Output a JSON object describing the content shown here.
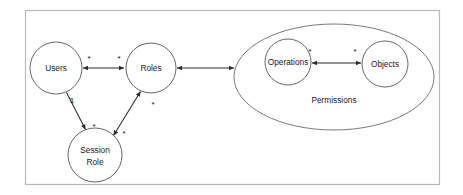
{
  "diagram": {
    "frame": {
      "name": "diagram-frame",
      "border_color": "#b9b9b9",
      "background": "#ffffff"
    },
    "colors": {
      "node_stroke": "#555555",
      "group_stroke": "#6b6b6b",
      "edge_stroke": "#2b2b2b",
      "frame_stroke": "#b9b9b9",
      "text": "#1a1a1a",
      "background": "#ffffff"
    },
    "nodes": [
      {
        "id": "users",
        "label": "Users",
        "shape": "circle",
        "cx": 56,
        "cy": 68,
        "r": 26
      },
      {
        "id": "roles",
        "label": "Roles",
        "shape": "circle",
        "cx": 151,
        "cy": 68,
        "r": 25
      },
      {
        "id": "session_role",
        "label_line1": "Session",
        "label_line2": "Role",
        "shape": "circle",
        "cx": 95,
        "cy": 155,
        "r": 27
      },
      {
        "id": "operations",
        "label": "Operations",
        "shape": "circle",
        "cx": 288,
        "cy": 62,
        "r": 23
      },
      {
        "id": "objects",
        "label": "Objects",
        "shape": "circle",
        "cx": 385,
        "cy": 64,
        "r": 23
      }
    ],
    "groups": [
      {
        "id": "permissions",
        "label": "Permissions",
        "shape": "ellipse",
        "cx": 334,
        "cy": 77,
        "rx": 100,
        "ry": 53
      }
    ],
    "edges": [
      {
        "id": "users-roles",
        "from": "users",
        "to": "roles",
        "arrows": "both",
        "source_multiplicity": "*",
        "target_multiplicity": "*"
      },
      {
        "id": "users-session-role",
        "from": "users",
        "to": "session_role",
        "arrows": "target",
        "source_multiplicity": "1",
        "target_multiplicity": "*"
      },
      {
        "id": "session-role-roles",
        "from": "session_role",
        "to": "roles",
        "arrows": "both",
        "source_multiplicity": "*",
        "target_multiplicity": "*"
      },
      {
        "id": "roles-permissions",
        "from": "roles",
        "to": "permissions",
        "arrows": "both",
        "source_multiplicity": "",
        "target_multiplicity": ""
      },
      {
        "id": "operations-objects",
        "from": "operations",
        "to": "objects",
        "arrows": "both",
        "source_multiplicity": "*",
        "target_multiplicity": "*"
      }
    ]
  }
}
